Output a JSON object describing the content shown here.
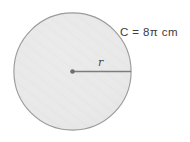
{
  "figure": {
    "kind": "geometry-diagram",
    "background_color": "#ffffff",
    "shape": {
      "name": "circle",
      "fill_color": "#e9e9e9",
      "stroke_color": "#9a9a9a",
      "center_x": 72.5,
      "center_y": 71.5,
      "radius": 59
    },
    "center_point": {
      "color": "#6e6e6e",
      "radius": 2.2
    },
    "radius_segment": {
      "color": "#7d7d7d",
      "from_x": 72.5,
      "from_y": 71.5,
      "to_x": 131.5,
      "to_y": 71.5
    },
    "labels": {
      "circumference": {
        "text": "C = 8π cm",
        "symbol": "C",
        "equals": "=",
        "coefficient": "8",
        "pi": "π",
        "unit": "cm",
        "color": "#3c3c3c"
      },
      "radius": {
        "text": "r",
        "color": "#4a4a4a"
      }
    }
  }
}
